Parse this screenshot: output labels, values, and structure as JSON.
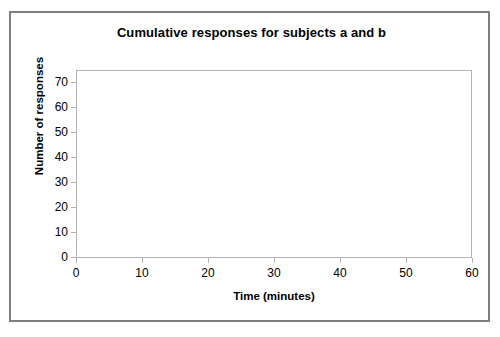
{
  "chart_data": {
    "type": "line",
    "title": "Cumulative responses for subjects a and b",
    "xlabel": "Time (minutes)",
    "ylabel": "Number of responses",
    "xlim": [
      0,
      60
    ],
    "ylim": [
      0,
      75
    ],
    "x_ticks": [
      0,
      10,
      20,
      30,
      40,
      50,
      60
    ],
    "y_ticks": [
      0,
      10,
      20,
      30,
      40,
      50,
      60,
      70
    ],
    "grid": false,
    "legend": false,
    "legend_position": "none",
    "series": [],
    "annotations": [],
    "note": "Blank plot area - axes drawn with no data series rendered"
  },
  "figure": {
    "title": "Cumulative responses for subjects a and b",
    "x_axis": {
      "label": "Time (minutes)",
      "tick_labels": [
        "0",
        "10",
        "20",
        "30",
        "40",
        "50",
        "60"
      ]
    },
    "y_axis": {
      "label": "Number of responses",
      "tick_labels": [
        "0",
        "10",
        "20",
        "30",
        "40",
        "50",
        "60",
        "70"
      ]
    }
  },
  "colors": {
    "frame_border": "#7f7f7f",
    "plot_border": "#b3b3b3",
    "tick": "#b3b3b3",
    "text": "#000000",
    "background": "#ffffff"
  }
}
